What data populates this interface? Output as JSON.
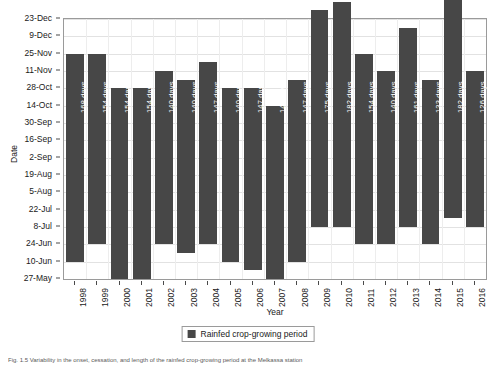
{
  "chart_data": {
    "type": "bar",
    "title": "",
    "xlabel": "Year",
    "ylabel": "Date",
    "grid": true,
    "legend_position": "bottom-center",
    "categories": [
      "1998",
      "1999",
      "2000",
      "2001",
      "2002",
      "2003",
      "2004",
      "2005",
      "2006",
      "2007",
      "2008",
      "2009",
      "2010",
      "2011",
      "2012",
      "2013",
      "2014",
      "2015",
      "2016"
    ],
    "yticks": [
      "27-May",
      "10-Jun",
      "24-Jun",
      "8-Jul",
      "22-Jul",
      "5-Aug",
      "19-Aug",
      "2-Sep",
      "16-Sep",
      "30-Sep",
      "14-Oct",
      "28-Oct",
      "11-Nov",
      "25-Nov",
      "9-Dec",
      "23-Dec"
    ],
    "ylim": [
      "27-May",
      "23-Dec"
    ],
    "ytick_interval_days": 14,
    "series": [
      {
        "name": "Rainfed crop-growing period",
        "color": "#474747",
        "value_unit": "days",
        "values": [
          168,
          154,
          154,
          154,
          140,
          140,
          147,
          140,
          147,
          140,
          147,
          175,
          182,
          154,
          140,
          161,
          133,
          182,
          126
        ],
        "labels": [
          "168 days",
          "154 days",
          "154 days",
          "154 days",
          "140 days",
          "140 days",
          "147 days",
          "140 days",
          "147 days",
          "140 days",
          "147 days",
          "175 days",
          "182 days",
          "154 days",
          "140 days",
          "161 days",
          "133 days",
          "182 days",
          "126 days"
        ],
        "start_day_offsets": [
          14,
          28,
          0,
          0,
          28,
          21,
          28,
          14,
          7,
          0,
          14,
          42,
          42,
          28,
          28,
          42,
          28,
          49,
          42
        ],
        "end_day_offsets": [
          182,
          182,
          154,
          154,
          168,
          161,
          175,
          154,
          154,
          140,
          161,
          217,
          224,
          182,
          168,
          203,
          161,
          231,
          168
        ]
      }
    ],
    "legend": [
      {
        "label": "Rainfed crop-growing period",
        "color": "#474747"
      }
    ]
  },
  "axis": {
    "y_title": "Date",
    "x_title": "Year"
  },
  "caption": {
    "text": "Fig. 1.5   Variability in the onset, cessation, and length of the rainfed crop-growing period at the Melkassa station"
  }
}
